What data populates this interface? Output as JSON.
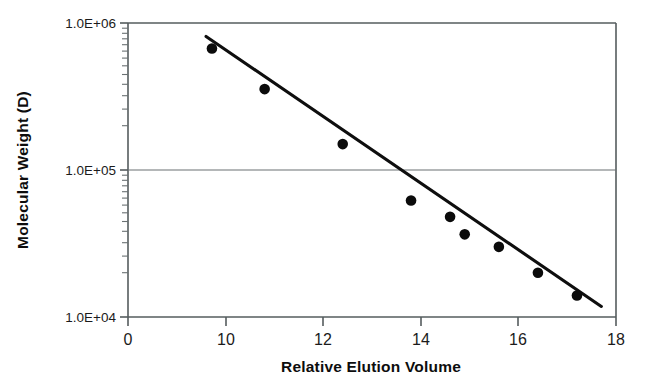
{
  "chart_data": {
    "type": "scatter",
    "title": "",
    "subtitle": "",
    "xlabel": "Relative Elution Volume",
    "ylabel": "Molecular Weight (D)",
    "yscale": "log",
    "ylim": [
      10000,
      1000000
    ],
    "xlim": [
      0,
      18
    ],
    "grid": "single horizontal gridline at 1.0E+05",
    "legend": "none",
    "y_tick_labels": [
      "1.0E+06",
      "1.0E+05",
      "1.0E+04"
    ],
    "y_tick_values": [
      1000000,
      100000,
      10000
    ],
    "x_tick_labels": [
      "0",
      "10",
      "12",
      "14",
      "16",
      "18"
    ],
    "x_tick_values": [
      0,
      10,
      12,
      14,
      16,
      18
    ],
    "x_axis_note": "tick labels are evenly spaced despite unequal numeric gaps",
    "series": [
      {
        "name": "calibration standards",
        "marker": "filled-circle",
        "color": "#0b0b0b",
        "points": [
          {
            "x": 8.6,
            "y": 670000
          },
          {
            "x": 10.8,
            "y": 355000
          },
          {
            "x": 12.4,
            "y": 150000
          },
          {
            "x": 13.8,
            "y": 62000
          },
          {
            "x": 14.6,
            "y": 48000
          },
          {
            "x": 14.9,
            "y": 36500
          },
          {
            "x": 15.6,
            "y": 30000
          },
          {
            "x": 16.4,
            "y": 20000
          },
          {
            "x": 17.2,
            "y": 14000
          }
        ]
      },
      {
        "name": "fitted regression line",
        "type": "line",
        "color": "#0e0e0e",
        "start": {
          "x": 8.0,
          "y": 810000
        },
        "end": {
          "x": 17.7,
          "y": 11800
        }
      }
    ]
  },
  "axes": {
    "y_label": "Molecular Weight (D)",
    "x_label": "Relative Elution Volume",
    "y_ticks": [
      {
        "label": "1.0E+06",
        "value": 1000000
      },
      {
        "label": "1.0E+05",
        "value": 100000
      },
      {
        "label": "1.0E+04",
        "value": 10000
      }
    ],
    "x_ticks": [
      {
        "label": "0",
        "value": 0
      },
      {
        "label": "10",
        "value": 10
      },
      {
        "label": "12",
        "value": 12
      },
      {
        "label": "14",
        "value": 14
      },
      {
        "label": "16",
        "value": 16
      },
      {
        "label": "18",
        "value": 18
      }
    ]
  },
  "colors": {
    "marker": "#0b0b0b",
    "line": "#0e0e0e",
    "axis": "#555c5e",
    "grid": "#6a7173",
    "background": "#ffffff",
    "text": "#1b1b1b"
  }
}
